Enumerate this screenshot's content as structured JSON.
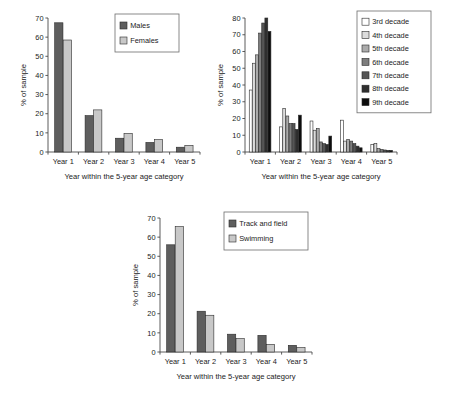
{
  "figure": {
    "panel_count": 3,
    "background_color": "#ffffff",
    "shared_xlabel": "Year within the 5-year age category",
    "shared_ylabel": "% of sample",
    "category_labels": [
      "Year 1",
      "Year 2",
      "Year 3",
      "Year 4",
      "Year 5"
    ]
  },
  "chart_data": [
    {
      "id": "panel-a",
      "type": "bar",
      "title": "",
      "xlabel": "Year within the 5-year age category",
      "ylabel": "% of sample",
      "categories": [
        "Year 1",
        "Year 2",
        "Year 3",
        "Year 4",
        "Year 5"
      ],
      "ylim": [
        0,
        70
      ],
      "yticks": [
        0,
        10,
        20,
        30,
        40,
        50,
        60,
        70
      ],
      "ytick_labels": [
        "0",
        "10",
        "20",
        "30",
        "40",
        "50",
        "60",
        "70"
      ],
      "grid": false,
      "legend_position": "top-right",
      "series": [
        {
          "name": "Males",
          "color": "#5e5e5e",
          "values": [
            67.5,
            19.0,
            7.2,
            5.0,
            2.5
          ]
        },
        {
          "name": "Females",
          "color": "#c8c8c8",
          "values": [
            58.5,
            22.0,
            9.7,
            6.5,
            3.5
          ]
        }
      ]
    },
    {
      "id": "panel-b",
      "type": "bar",
      "title": "",
      "xlabel": "Year within the 5-year age category",
      "ylabel": "% of sample",
      "categories": [
        "Year 1",
        "Year 2",
        "Year 3",
        "Year 4",
        "Year 5"
      ],
      "ylim": [
        0,
        80
      ],
      "yticks": [
        0,
        10,
        20,
        30,
        40,
        50,
        60,
        70,
        80
      ],
      "ytick_labels": [
        "0",
        "10",
        "20",
        "30",
        "40",
        "50",
        "60",
        "70",
        "80"
      ],
      "grid": false,
      "legend_position": "top-right",
      "series": [
        {
          "name": "3rd decade",
          "color": "#ffffff",
          "values": [
            37.0,
            15.0,
            18.5,
            19.0,
            4.5
          ]
        },
        {
          "name": "4th decade",
          "color": "#dcdcdc",
          "values": [
            53.0,
            26.0,
            13.0,
            6.5,
            5.0
          ]
        },
        {
          "name": "5th decade",
          "color": "#ababab",
          "values": [
            58.0,
            21.5,
            14.0,
            7.5,
            2.0
          ]
        },
        {
          "name": "6th decade",
          "color": "#7d7d7d",
          "values": [
            71.0,
            17.0,
            6.0,
            6.5,
            1.5
          ]
        },
        {
          "name": "7th decade",
          "color": "#555555",
          "values": [
            77.0,
            17.0,
            5.0,
            5.0,
            1.2
          ]
        },
        {
          "name": "8th decade",
          "color": "#2f2f2f",
          "values": [
            80.0,
            13.5,
            4.5,
            3.5,
            1.0
          ]
        },
        {
          "name": "9th decade",
          "color": "#0d0d0d",
          "values": [
            72.0,
            22.0,
            9.5,
            2.5,
            1.0
          ]
        }
      ]
    },
    {
      "id": "panel-c",
      "type": "bar",
      "title": "",
      "xlabel": "Year within the 5-year age category",
      "ylabel": "% of sample",
      "categories": [
        "Year 1",
        "Year 2",
        "Year 3",
        "Year 4",
        "Year 5"
      ],
      "ylim": [
        0,
        70
      ],
      "yticks": [
        0,
        10,
        20,
        30,
        40,
        50,
        60,
        70
      ],
      "ytick_labels": [
        "0",
        "10",
        "20",
        "30",
        "40",
        "50",
        "60",
        "70"
      ],
      "grid": false,
      "legend_position": "top-right",
      "series": [
        {
          "name": "Track and field",
          "color": "#5e5e5e",
          "values": [
            56.0,
            21.3,
            9.3,
            8.7,
            3.5
          ]
        },
        {
          "name": "Swimming",
          "color": "#c8c8c8",
          "values": [
            65.5,
            19.2,
            7.0,
            4.0,
            2.3
          ]
        }
      ]
    }
  ]
}
